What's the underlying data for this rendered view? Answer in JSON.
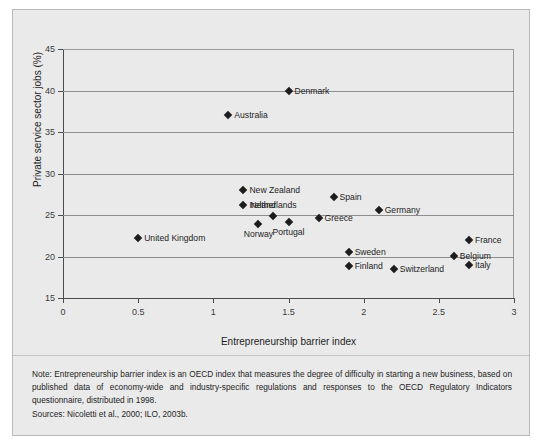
{
  "figure": {
    "background_color": "#eaeaea",
    "border_color": "#b9b9b9",
    "marker_color": "#1d1d1d",
    "grid_color": "#8d8d8d"
  },
  "chart_data": {
    "type": "scatter",
    "title": "",
    "xlabel": "Entrepreneurship barrier index",
    "ylabel": "Private service sector jobs (%)",
    "xlim": [
      0,
      3
    ],
    "ylim": [
      15,
      45
    ],
    "xticks": [
      "0",
      "0.5",
      "1",
      "1.5",
      "2",
      "2.5",
      "3"
    ],
    "xtick_values": [
      0,
      0.5,
      1,
      1.5,
      2,
      2.5,
      3
    ],
    "yticks": [
      "15",
      "20",
      "25",
      "30",
      "35",
      "40",
      "45"
    ],
    "ytick_values": [
      15,
      20,
      25,
      30,
      35,
      40,
      45
    ],
    "grid": "horizontal",
    "legend": "none",
    "points": [
      {
        "label": "Denmark",
        "x": 1.5,
        "y": 40.0,
        "label_pos": "right"
      },
      {
        "label": "Australia",
        "x": 1.1,
        "y": 37.0,
        "label_pos": "right"
      },
      {
        "label": "New Zealand",
        "x": 1.2,
        "y": 28.0,
        "label_pos": "right"
      },
      {
        "label": "Spain",
        "x": 1.8,
        "y": 27.2,
        "label_pos": "right"
      },
      {
        "label": "Ireland",
        "x": 1.2,
        "y": 26.2,
        "label_pos": "right"
      },
      {
        "label": "Germany",
        "x": 2.1,
        "y": 25.6,
        "label_pos": "right"
      },
      {
        "label": "Netherlands",
        "x": 1.4,
        "y": 24.9,
        "label_pos": "above"
      },
      {
        "label": "Greece",
        "x": 1.7,
        "y": 24.6,
        "label_pos": "right"
      },
      {
        "label": "Portugal",
        "x": 1.5,
        "y": 24.1,
        "label_pos": "below"
      },
      {
        "label": "Norway",
        "x": 1.3,
        "y": 23.9,
        "label_pos": "below"
      },
      {
        "label": "United Kingdom",
        "x": 0.5,
        "y": 22.2,
        "label_pos": "right"
      },
      {
        "label": "France",
        "x": 2.7,
        "y": 22.0,
        "label_pos": "right"
      },
      {
        "label": "Sweden",
        "x": 1.9,
        "y": 20.5,
        "label_pos": "right"
      },
      {
        "label": "Belgium",
        "x": 2.6,
        "y": 20.1,
        "label_pos": "right"
      },
      {
        "label": "Italy",
        "x": 2.7,
        "y": 19.0,
        "label_pos": "right"
      },
      {
        "label": "Finland",
        "x": 1.9,
        "y": 18.8,
        "label_pos": "right"
      },
      {
        "label": "Switzerland",
        "x": 2.2,
        "y": 18.5,
        "label_pos": "right"
      }
    ]
  },
  "footer": {
    "note": "Note: Entrepreneurship barrier index is an OECD index that measures the degree of difficulty in starting a new business, based on published data of economy-wide and industry-specific regulations and responses to the OECD Regulatory Indicators questionnaire, distributed in 1998.",
    "sources": "Sources: Nicoletti et al., 2000; ILO, 2003b."
  }
}
